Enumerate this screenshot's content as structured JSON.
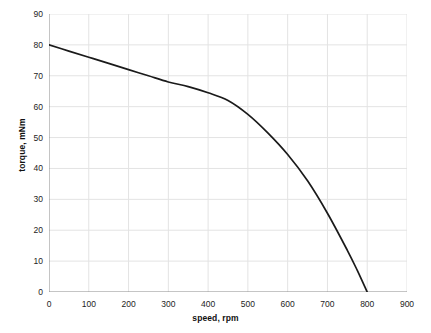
{
  "chart_data": {
    "type": "line",
    "title": "",
    "xlabel": "speed, rpm",
    "ylabel": "torque, mNm",
    "xlim": [
      0,
      900
    ],
    "ylim": [
      0,
      90
    ],
    "xticks": [
      0,
      100,
      200,
      300,
      400,
      500,
      600,
      700,
      800,
      900
    ],
    "yticks": [
      0,
      10,
      20,
      30,
      40,
      50,
      60,
      70,
      80,
      90
    ],
    "grid": true,
    "legend": "none",
    "series": [
      {
        "name": "torque-speed curve",
        "color": "#1a1a1a",
        "x": [
          0,
          50,
          100,
          150,
          200,
          250,
          300,
          350,
          400,
          450,
          500,
          550,
          600,
          650,
          700,
          750,
          775,
          800
        ],
        "values": [
          80,
          78,
          76,
          74,
          72,
          70,
          68,
          66.5,
          64.5,
          62,
          57.5,
          51.5,
          44.5,
          36,
          25.5,
          13.5,
          7,
          0
        ]
      }
    ]
  },
  "axes": {
    "x_tick_labels": [
      "0",
      "100",
      "200",
      "300",
      "400",
      "500",
      "600",
      "700",
      "800",
      "900"
    ],
    "y_tick_labels": [
      "0",
      "10",
      "20",
      "30",
      "40",
      "50",
      "60",
      "70",
      "80",
      "90"
    ],
    "x_title": "speed, rpm",
    "y_title": "torque, mNm"
  },
  "style": {
    "axis_color": "#8a8a8a",
    "grid_color": "#e3e3e3",
    "curve_color": "#1a1a1a",
    "background": "#ffffff"
  }
}
